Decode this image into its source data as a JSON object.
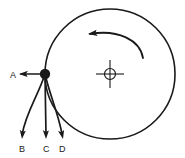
{
  "figure": {
    "background_color": "#ffffff",
    "stroke_color": "#1a1a1a",
    "label_color": "#1a1a1a",
    "width": 185,
    "height": 158
  },
  "wheel": {
    "name": "wheel-circle",
    "center_x": 110,
    "center_y": 74,
    "radius": 65,
    "stroke_width": 1.6
  },
  "axle": {
    "name": "axle-crosshair",
    "center_x": 110,
    "center_y": 74,
    "hub_radius": 5.5,
    "arm_length": 14,
    "stroke_width": 1.1
  },
  "rotation_arrow": {
    "name": "rotation-direction-arrow",
    "direction": "counterclockwise",
    "path": "M 143 58 C 140 40 118 29 90 34",
    "arrow_tip_x": 88,
    "arrow_tip_y": 34,
    "stroke_width": 1.8
  },
  "contact_point": {
    "name": "contact-point-dot",
    "x": 45,
    "y": 74,
    "radius": 5.2
  },
  "vectors": [
    {
      "id": "A",
      "label": "A",
      "name": "vector-a",
      "type": "straight",
      "path": "M 45 74 L 21 74",
      "tip_x": 19,
      "tip_y": 74,
      "angle_deg": 180,
      "label_x": 10,
      "label_y": 78
    },
    {
      "id": "B",
      "label": "B",
      "name": "vector-b",
      "type": "curved",
      "path": "M 45 74 C 38 96 26 112 22 135",
      "tip_x": 22,
      "tip_y": 139,
      "angle_deg": 96,
      "label_x": 19,
      "label_y": 152
    },
    {
      "id": "C",
      "label": "C",
      "name": "vector-c",
      "type": "straight",
      "path": "M 45 74 L 46 135",
      "tip_x": 46,
      "tip_y": 139,
      "angle_deg": 90,
      "label_x": 43,
      "label_y": 152
    },
    {
      "id": "D",
      "label": "D",
      "name": "vector-d",
      "type": "curved",
      "path": "M 45 74 C 50 96 58 112 62 134",
      "tip_x": 63,
      "tip_y": 139,
      "angle_deg": 78,
      "label_x": 59,
      "label_y": 152
    }
  ]
}
